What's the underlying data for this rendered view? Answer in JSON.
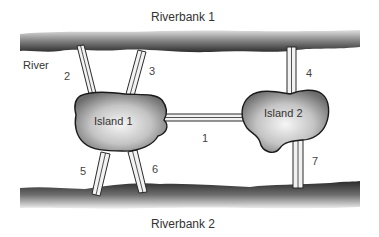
{
  "labels": {
    "riverbank_top": "Riverbank 1",
    "riverbank_bottom": "Riverbank 2",
    "river": "River",
    "island_1": "Island 1",
    "island_2": "Island 2"
  },
  "bridges": [
    {
      "id": "1",
      "connects": [
        "Island 1",
        "Island 2"
      ]
    },
    {
      "id": "2",
      "connects": [
        "Riverbank 1",
        "Island 1"
      ]
    },
    {
      "id": "3",
      "connects": [
        "Riverbank 1",
        "Island 1"
      ]
    },
    {
      "id": "4",
      "connects": [
        "Riverbank 1",
        "Island 2"
      ]
    },
    {
      "id": "5",
      "connects": [
        "Island 1",
        "Riverbank 2"
      ]
    },
    {
      "id": "6",
      "connects": [
        "Island 1",
        "Riverbank 2"
      ]
    },
    {
      "id": "7",
      "connects": [
        "Island 2",
        "Riverbank 2"
      ]
    }
  ],
  "colors": {
    "bank_dark": "#3a3a3a",
    "bank_light": "#d8d8d8",
    "island_edge": "#1a1a1a",
    "island_fill_center": "#f4f4f4",
    "island_fill_edge": "#7a7a7a",
    "bridge_fill": "#f2f2f2",
    "bridge_stroke": "#2a2a2a"
  }
}
